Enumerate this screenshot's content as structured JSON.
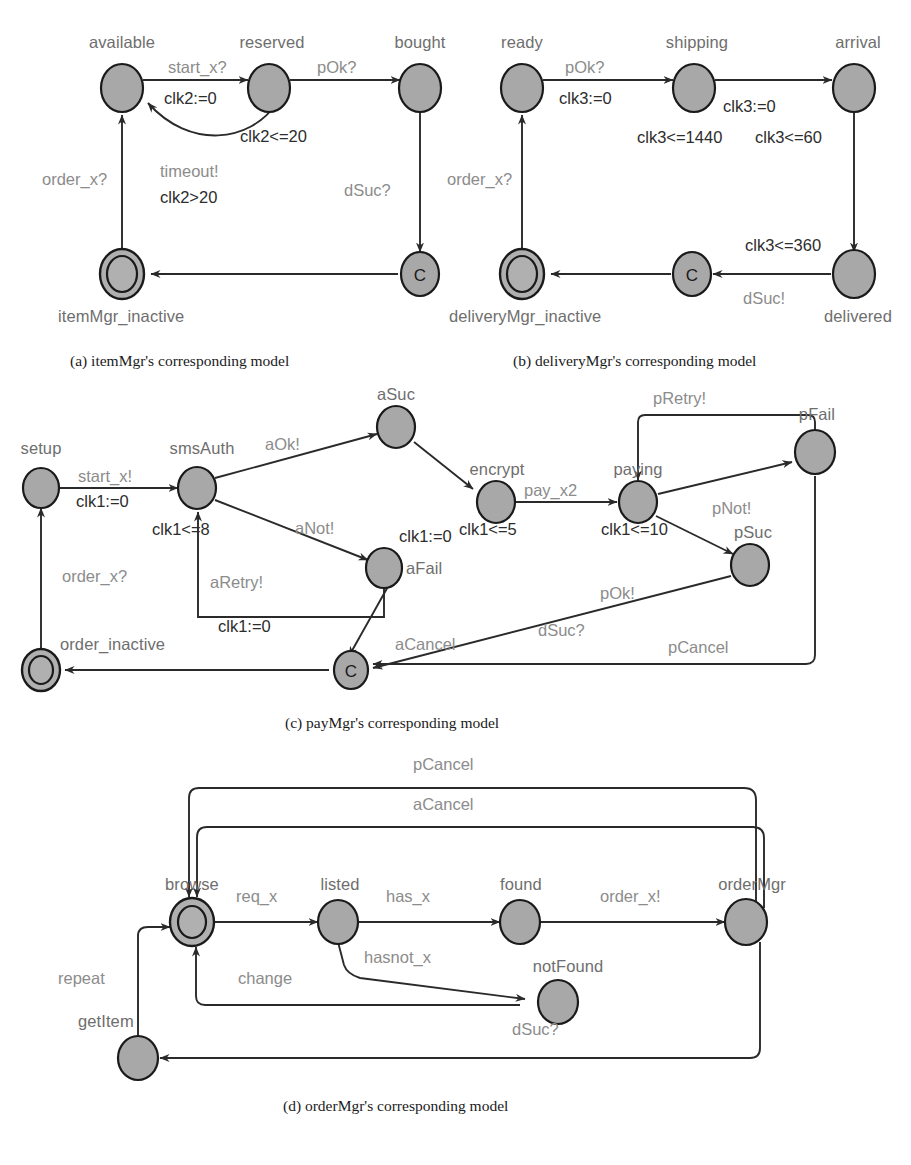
{
  "page": {
    "width": 911,
    "height": 1165,
    "background": "#ffffff",
    "node_fill": "#a8a8a8",
    "node_stroke": "#1a1a1a",
    "state_label_color": "#6e6e6e",
    "edge_label_color": "#8c8c8c",
    "guard_label_color": "#2d2d2d"
  },
  "figures": [
    {
      "id": "a",
      "caption": "(a) itemMgr's corresponding model",
      "states": [
        {
          "name": "available",
          "kind": "normal"
        },
        {
          "name": "reserved",
          "kind": "normal"
        },
        {
          "name": "bought",
          "kind": "normal"
        },
        {
          "name": "itemMgr_inactive",
          "kind": "initial"
        },
        {
          "name": "C",
          "kind": "committed"
        }
      ],
      "transitions": [
        {
          "from": "available",
          "to": "reserved",
          "sync": "start_x?",
          "assign": "clk2:=0"
        },
        {
          "from": "reserved",
          "to": "bought",
          "sync": "pOk?",
          "assign": ""
        },
        {
          "from": "reserved",
          "to": "available",
          "sync": "timeout!",
          "guard": "clk2>20"
        },
        {
          "from": "bought",
          "to": "C",
          "sync": "dSuc?",
          "assign": ""
        },
        {
          "from": "C",
          "to": "itemMgr_inactive",
          "sync": "",
          "assign": ""
        },
        {
          "from": "itemMgr_inactive",
          "to": "available",
          "sync": "order_x?",
          "assign": ""
        }
      ],
      "invariants": [
        {
          "state": "reserved",
          "text": "clk2<=20"
        }
      ],
      "labels": {
        "start_x": "start_x?",
        "clk2_reset": "clk2:=0",
        "pOk": "pOk?",
        "clk2_inv": "clk2<=20",
        "timeout": "timeout!",
        "clk2_guard": "clk2>20",
        "dSuc": "dSuc?",
        "order_x": "order_x?",
        "available": "available",
        "reserved": "reserved",
        "bought": "bought",
        "inactive": "itemMgr_inactive",
        "committed": "C"
      }
    },
    {
      "id": "b",
      "caption": "(b) deliveryMgr's corresponding model",
      "states": [
        {
          "name": "ready",
          "kind": "normal"
        },
        {
          "name": "shipping",
          "kind": "normal"
        },
        {
          "name": "arrival",
          "kind": "normal"
        },
        {
          "name": "delivered",
          "kind": "normal"
        },
        {
          "name": "deliveryMgr_inactive",
          "kind": "initial"
        },
        {
          "name": "C",
          "kind": "committed"
        }
      ],
      "transitions": [
        {
          "from": "ready",
          "to": "shipping",
          "sync": "pOk?",
          "assign": "clk3:=0"
        },
        {
          "from": "shipping",
          "to": "arrival",
          "sync": "",
          "assign": "clk3:=0"
        },
        {
          "from": "arrival",
          "to": "delivered",
          "sync": "",
          "assign": ""
        },
        {
          "from": "delivered",
          "to": "C",
          "sync": "dSuc!",
          "assign": ""
        },
        {
          "from": "C",
          "to": "deliveryMgr_inactive",
          "sync": "",
          "assign": ""
        },
        {
          "from": "deliveryMgr_inactive",
          "to": "ready",
          "sync": "order_x?",
          "assign": ""
        }
      ],
      "invariants": [
        {
          "state": "shipping",
          "text": "clk3<=1440"
        },
        {
          "state": "arrival",
          "text": "clk3<=60"
        },
        {
          "state": "delivered",
          "text": "clk3<=360"
        }
      ],
      "labels": {
        "ready": "ready",
        "shipping": "shipping",
        "arrival": "arrival",
        "delivered": "delivered",
        "inactive": "deliveryMgr_inactive",
        "committed": "C",
        "pOk": "pOk?",
        "clk3_reset1": "clk3:=0",
        "clk3_reset2": "clk3:=0",
        "inv_shipping": "clk3<=1440",
        "inv_arrival": "clk3<=60",
        "inv_delivered": "clk3<=360",
        "dSuc": "dSuc!",
        "order_x": "order_x?"
      }
    },
    {
      "id": "c",
      "caption": "(c) payMgr's corresponding model",
      "states": [
        {
          "name": "setup",
          "kind": "normal"
        },
        {
          "name": "smsAuth",
          "kind": "normal"
        },
        {
          "name": "aSuc",
          "kind": "normal"
        },
        {
          "name": "aFail",
          "kind": "normal"
        },
        {
          "name": "encrypt",
          "kind": "normal"
        },
        {
          "name": "paying",
          "kind": "normal"
        },
        {
          "name": "pFail",
          "kind": "normal"
        },
        {
          "name": "pSuc",
          "kind": "normal"
        },
        {
          "name": "order_inactive",
          "kind": "initial"
        },
        {
          "name": "C",
          "kind": "committed"
        }
      ],
      "transitions": [
        {
          "from": "order_inactive",
          "to": "setup",
          "sync": "order_x?",
          "assign": ""
        },
        {
          "from": "setup",
          "to": "smsAuth",
          "sync": "start_x!",
          "assign": "clk1:=0"
        },
        {
          "from": "smsAuth",
          "to": "aSuc",
          "sync": "aOk!",
          "assign": ""
        },
        {
          "from": "smsAuth",
          "to": "aFail",
          "sync": "aNot!",
          "assign": ""
        },
        {
          "from": "aFail",
          "to": "smsAuth",
          "sync": "aRetry!",
          "assign": "clk1:=0"
        },
        {
          "from": "aFail",
          "to": "C",
          "sync": "aCancel",
          "assign": ""
        },
        {
          "from": "aSuc",
          "to": "encrypt",
          "sync": "",
          "assign": "clk1:=0"
        },
        {
          "from": "encrypt",
          "to": "paying",
          "sync": "pay_x2",
          "assign": ""
        },
        {
          "from": "paying",
          "to": "pFail",
          "sync": "pNot!",
          "assign": ""
        },
        {
          "from": "paying",
          "to": "pSuc",
          "sync": "",
          "assign": ""
        },
        {
          "from": "pFail",
          "to": "paying",
          "sync": "pRetry!",
          "assign": ""
        },
        {
          "from": "pFail",
          "to": "C",
          "sync": "pCancel",
          "assign": ""
        },
        {
          "from": "pSuc",
          "to": "C",
          "sync": "pOk!  dSuc?",
          "assign": ""
        },
        {
          "from": "C",
          "to": "order_inactive",
          "sync": "",
          "assign": ""
        }
      ],
      "invariants": [
        {
          "state": "smsAuth",
          "text": "clk1<=8"
        },
        {
          "state": "encrypt",
          "text": "clk1<=5"
        },
        {
          "state": "paying",
          "text": "clk1<=10"
        }
      ],
      "labels": {
        "setup": "setup",
        "smsAuth": "smsAuth",
        "aSuc": "aSuc",
        "aFail": "aFail",
        "encrypt": "encrypt",
        "paying": "paying",
        "pFail": "pFail",
        "pSuc": "pSuc",
        "order_inactive": "order_inactive",
        "committed": "C",
        "start_x": "start_x!",
        "clk1_reset_setup": "clk1:=0",
        "inv_smsAuth": "clk1<=8",
        "aOk": "aOk!",
        "aNot": "aNot!",
        "aRetry": "aRetry!",
        "clk1_reset_retry": "clk1:=0",
        "clk1_reset_asuc": "clk1:=0",
        "inv_encrypt": "clk1<=5",
        "pay_x2": "pay_x2",
        "inv_paying": "clk1<=10",
        "pRetry": "pRetry!",
        "pNot": "pNot!",
        "pOk": "pOk!",
        "dSuc": "dSuc?",
        "aCancel": "aCancel",
        "pCancel": "pCancel",
        "order_x": "order_x?"
      }
    },
    {
      "id": "d",
      "caption": "(d) orderMgr's corresponding model",
      "states": [
        {
          "name": "browse",
          "kind": "initial"
        },
        {
          "name": "listed",
          "kind": "normal"
        },
        {
          "name": "found",
          "kind": "normal"
        },
        {
          "name": "notFound",
          "kind": "normal"
        },
        {
          "name": "orderMgr",
          "kind": "normal"
        },
        {
          "name": "getItem",
          "kind": "normal"
        }
      ],
      "transitions": [
        {
          "from": "browse",
          "to": "listed",
          "sync": "req_x",
          "assign": ""
        },
        {
          "from": "listed",
          "to": "found",
          "sync": "has_x",
          "assign": ""
        },
        {
          "from": "listed",
          "to": "notFound",
          "sync": "hasnot_x",
          "assign": ""
        },
        {
          "from": "found",
          "to": "orderMgr",
          "sync": "order_x!",
          "assign": ""
        },
        {
          "from": "notFound",
          "to": "browse",
          "sync": "change",
          "assign": ""
        },
        {
          "from": "orderMgr",
          "to": "browse",
          "sync": "pCancel",
          "assign": ""
        },
        {
          "from": "orderMgr",
          "to": "browse",
          "sync": "aCancel",
          "assign": ""
        },
        {
          "from": "orderMgr",
          "to": "getItem",
          "sync": "dSuc?",
          "assign": ""
        },
        {
          "from": "getItem",
          "to": "browse",
          "sync": "repeat",
          "assign": ""
        }
      ],
      "invariants": [],
      "labels": {
        "browse": "browse",
        "listed": "listed",
        "found": "found",
        "notFound": "notFound",
        "orderMgr": "orderMgr",
        "getItem": "getItem",
        "req_x": "req_x",
        "has_x": "has_x",
        "hasnot_x": "hasnot_x",
        "order_x": "order_x!",
        "change": "change",
        "pCancel": "pCancel",
        "aCancel": "aCancel",
        "dSuc": "dSuc?",
        "repeat": "repeat"
      }
    }
  ]
}
